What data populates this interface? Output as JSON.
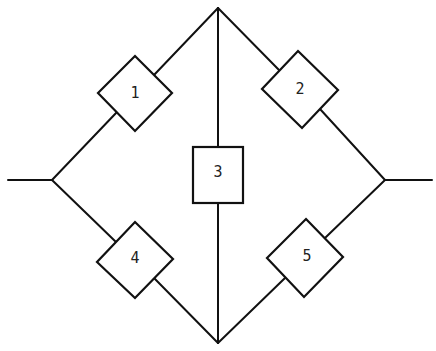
{
  "diagram": {
    "type": "bridge-network",
    "colors": {
      "line": "#111111",
      "background": "#ffffff"
    },
    "components": [
      {
        "id": "1",
        "label": "1",
        "shape": "diamond"
      },
      {
        "id": "2",
        "label": "2",
        "shape": "diamond"
      },
      {
        "id": "3",
        "label": "3",
        "shape": "square"
      },
      {
        "id": "4",
        "label": "4",
        "shape": "diamond"
      },
      {
        "id": "5",
        "label": "5",
        "shape": "diamond"
      }
    ],
    "connections": [
      {
        "from": "left-terminal",
        "to": "1"
      },
      {
        "from": "1",
        "to": "top-node"
      },
      {
        "from": "top-node",
        "to": "2"
      },
      {
        "from": "2",
        "to": "right-terminal"
      },
      {
        "from": "left-terminal",
        "to": "4"
      },
      {
        "from": "4",
        "to": "bottom-node"
      },
      {
        "from": "bottom-node",
        "to": "5"
      },
      {
        "from": "5",
        "to": "right-terminal"
      },
      {
        "from": "top-node",
        "to": "3"
      },
      {
        "from": "3",
        "to": "bottom-node"
      }
    ]
  }
}
